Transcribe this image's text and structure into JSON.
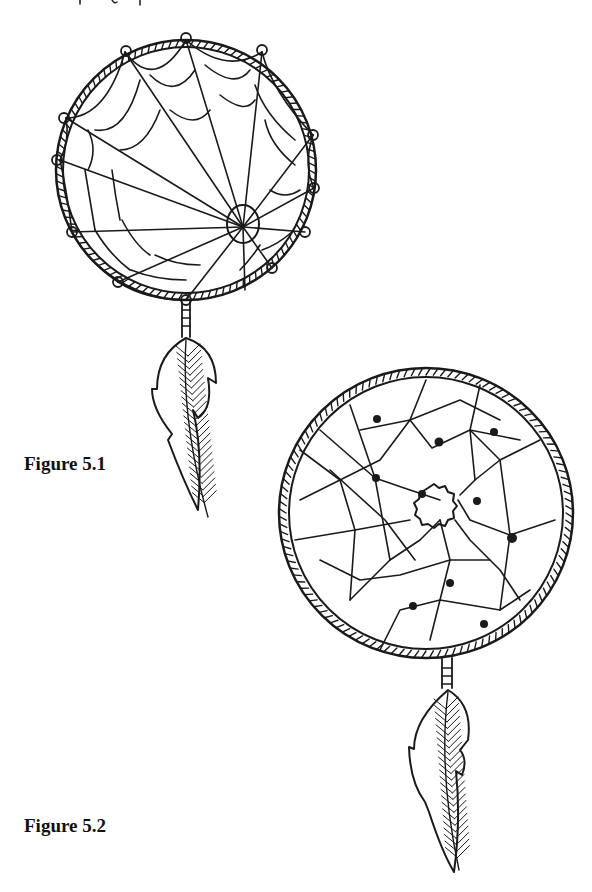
{
  "page": {
    "top_text_fragment": "…y  g  p…"
  },
  "figures": [
    {
      "id": "fig-5-1",
      "caption": "Figure 5.1",
      "description": "Dreamcatcher with spider-web weave and single hanging feather"
    },
    {
      "id": "fig-5-2",
      "caption": "Figure 5.2",
      "description": "Dreamcatcher with irregular net weave, beads, and single hanging feather"
    }
  ],
  "colors": {
    "ink": "#1a1a1a",
    "background": "#ffffff"
  }
}
